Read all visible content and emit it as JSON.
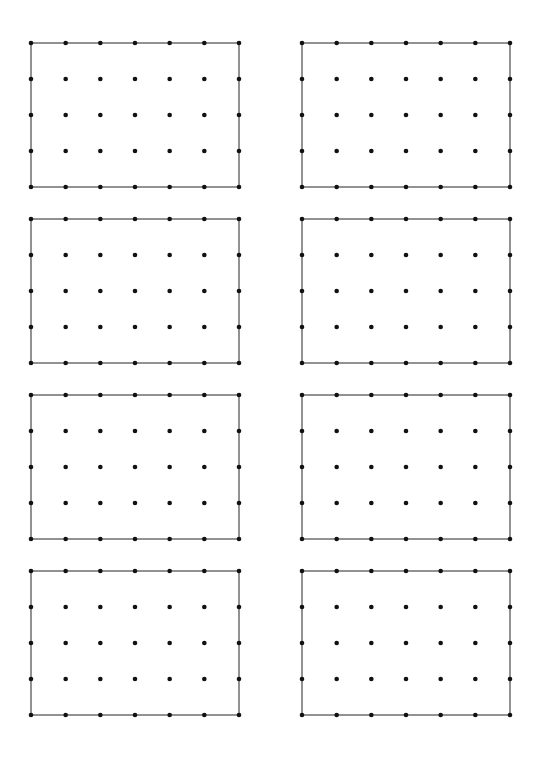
{
  "page": {
    "background": "#ffffff",
    "line_color": "#4a4a4a",
    "dot_color": "#111111"
  },
  "grid_spec": {
    "columns": 7,
    "rows": 5,
    "width": 208,
    "height": 144,
    "dot_radius": 2.3,
    "border_width": 1.2
  },
  "grids": [
    {
      "id": "grid-1",
      "x": 31,
      "y": 43
    },
    {
      "id": "grid-2",
      "x": 302,
      "y": 43
    },
    {
      "id": "grid-3",
      "x": 31,
      "y": 219
    },
    {
      "id": "grid-4",
      "x": 302,
      "y": 219
    },
    {
      "id": "grid-5",
      "x": 31,
      "y": 395
    },
    {
      "id": "grid-6",
      "x": 302,
      "y": 395
    },
    {
      "id": "grid-7",
      "x": 31,
      "y": 571
    },
    {
      "id": "grid-8",
      "x": 302,
      "y": 571
    }
  ]
}
